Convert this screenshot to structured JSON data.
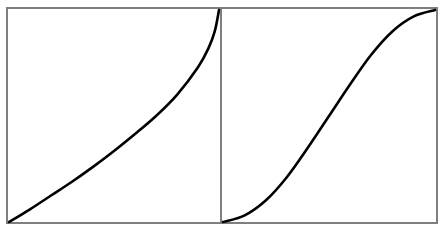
{
  "colors": {
    "background": "#ffffff",
    "frame": "#7f7f7f",
    "curve": "#000000"
  },
  "panels": [
    {
      "id": "left",
      "frame": {
        "x": 7,
        "y": 8,
        "w": 214,
        "h": 215
      },
      "curve_type": "convex-then-steep (inverse CDF-like)"
    },
    {
      "id": "right",
      "frame": {
        "x": 221,
        "y": 8,
        "w": 216,
        "h": 215
      },
      "curve_type": "sigmoid (S-curve)"
    }
  ],
  "chart_data": [
    {
      "type": "line",
      "title": "",
      "xlabel": "",
      "ylabel": "",
      "xlim": [
        0,
        1
      ],
      "ylim": [
        0,
        1
      ],
      "grid": false,
      "legend": null,
      "ticks": "none",
      "series": [
        {
          "name": "left-curve",
          "x": [
            0.0,
            0.1,
            0.2,
            0.3,
            0.4,
            0.5,
            0.6,
            0.7,
            0.8,
            0.9,
            0.95,
            0.98,
            1.0
          ],
          "y": [
            0.0,
            0.06,
            0.125,
            0.19,
            0.26,
            0.335,
            0.415,
            0.5,
            0.6,
            0.73,
            0.82,
            0.9,
            1.0
          ]
        }
      ]
    },
    {
      "type": "line",
      "title": "",
      "xlabel": "",
      "ylabel": "",
      "xlim": [
        0,
        1
      ],
      "ylim": [
        0,
        1
      ],
      "grid": false,
      "legend": null,
      "ticks": "none",
      "series": [
        {
          "name": "right-curve",
          "x": [
            0.0,
            0.1,
            0.2,
            0.3,
            0.4,
            0.5,
            0.6,
            0.7,
            0.8,
            0.9,
            1.0
          ],
          "y": [
            0.0,
            0.03,
            0.1,
            0.21,
            0.35,
            0.5,
            0.65,
            0.79,
            0.9,
            0.97,
            1.0
          ]
        }
      ]
    }
  ]
}
